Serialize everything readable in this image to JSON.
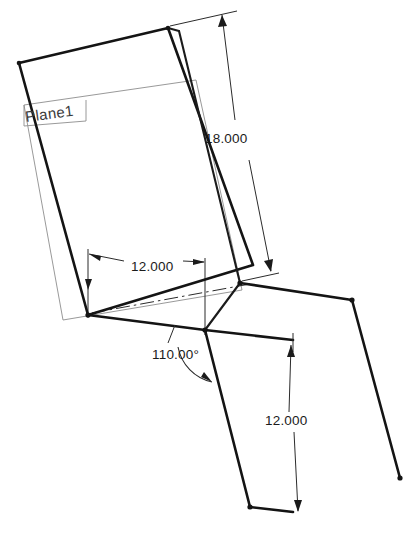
{
  "drawing": {
    "title": "Sheet metal bend CAD drawing",
    "background_color": "#ffffff",
    "line_color": "#141414",
    "dimension_color": "#2b2b2b",
    "plane_outline_color": "#8d8d8d",
    "labels": {
      "plane": "Plane1"
    },
    "dimensions": [
      {
        "id": "length-18",
        "name": "flange-length-dimension",
        "value": "18.000",
        "text_x": 205,
        "text_y": 143,
        "rotation": 0
      },
      {
        "id": "width-12-top",
        "name": "plane-width-dimension",
        "value": "12.000",
        "text_x": 131,
        "text_y": 271,
        "rotation": 0
      },
      {
        "id": "angle-110",
        "name": "bend-angle-dimension",
        "value": "110.00°",
        "text_x": 152,
        "text_y": 359,
        "rotation": 0
      },
      {
        "id": "length-12-bottom",
        "name": "lower-flange-dimension",
        "value": "12.000",
        "text_x": 265,
        "text_y": 425,
        "rotation": 0
      }
    ],
    "geometry": {
      "upper_panel_outer": "19,63 168,28 253,265 88,315",
      "upper_panel_inner_right": "180,32 240,283",
      "plane_rect": "24,105 196,80 242,290 63,320",
      "lower_left_edge": "88,315 205,330 250,507",
      "lower_right_edge": "240,283 352,300 400,478",
      "bend_line": "205,330 293,340",
      "bottom_edge": "250,507 293,512",
      "center_line": "92,313 248,284"
    }
  }
}
